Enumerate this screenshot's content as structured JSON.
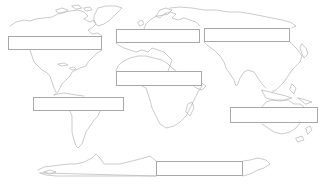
{
  "diagram": {
    "type": "blank world map worksheet",
    "outline_color": "#b4b4b4",
    "box_border_color": "#a8a8a8",
    "box_fill_color": "#ffffff",
    "label_boxes": [
      {
        "id": "north-america",
        "x": 8,
        "y": 36,
        "w": 94,
        "h": 14,
        "value": ""
      },
      {
        "id": "europe",
        "x": 116,
        "y": 29,
        "w": 84,
        "h": 14,
        "value": ""
      },
      {
        "id": "asia",
        "x": 204,
        "y": 28,
        "w": 86,
        "h": 14,
        "value": ""
      },
      {
        "id": "africa",
        "x": 116,
        "y": 71,
        "w": 86,
        "h": 15,
        "value": ""
      },
      {
        "id": "south-america",
        "x": 33,
        "y": 97,
        "w": 91,
        "h": 14,
        "value": ""
      },
      {
        "id": "oceania",
        "x": 230,
        "y": 107,
        "w": 88,
        "h": 16,
        "value": ""
      },
      {
        "id": "antarctica",
        "x": 156,
        "y": 161,
        "w": 87,
        "h": 15,
        "value": ""
      }
    ]
  }
}
